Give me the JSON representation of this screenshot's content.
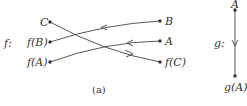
{
  "diagram": {
    "left": {
      "map_label": "f:",
      "left_nodes": [
        {
          "id": "C",
          "label": "C"
        },
        {
          "id": "fB",
          "label": "f(B)"
        },
        {
          "id": "fA",
          "label": "f(A)"
        }
      ],
      "right_nodes": [
        {
          "id": "B",
          "label": "B"
        },
        {
          "id": "A",
          "label": "A"
        },
        {
          "id": "fC",
          "label": "f(C)"
        }
      ],
      "edges": [
        {
          "from": "B",
          "to": "fB"
        },
        {
          "from": "A",
          "to": "fA"
        },
        {
          "from": "C",
          "to": "fC"
        }
      ],
      "caption": "(a)"
    },
    "right": {
      "map_label": "g:",
      "top_node": {
        "id": "A",
        "label": "A"
      },
      "bottom_node": {
        "id": "gA",
        "label": "g(A)"
      },
      "edges": [
        {
          "from": "A",
          "to": "gA"
        }
      ]
    },
    "colors": {
      "line": "#444444",
      "text": "#333333"
    }
  }
}
